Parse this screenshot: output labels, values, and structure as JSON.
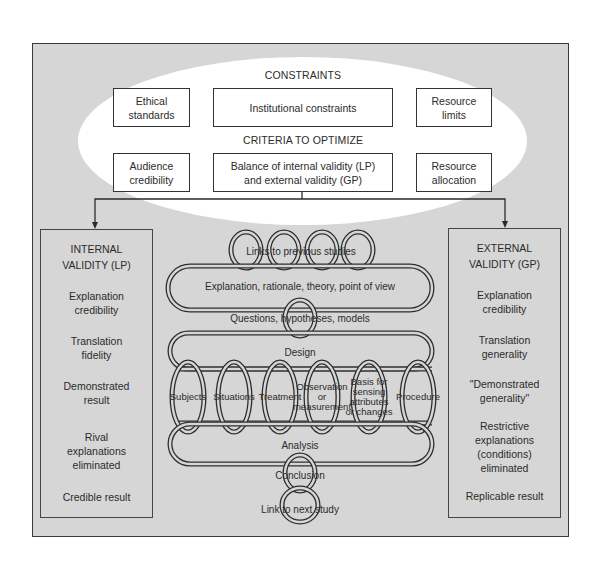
{
  "top_section": {
    "constraints_heading": "CONSTRAINTS",
    "constraints": [
      {
        "label": "Ethical\nstandards"
      },
      {
        "label": "Institutional constraints"
      },
      {
        "label": "Resource\nlimits"
      }
    ],
    "criteria_heading": "CRITERIA TO OPTIMIZE",
    "criteria": [
      {
        "label": "Audience\ncredibility"
      },
      {
        "label": "Balance of internal validity (LP)\nand external validity (GP)"
      },
      {
        "label": "Resource\nallocation"
      }
    ]
  },
  "internal_validity": {
    "title": "INTERNAL\nVALIDITY (LP)",
    "items": [
      "Explanation\ncredibility",
      "Translation\nfidelity",
      "Demonstrated\nresult",
      "Rival\nexplanations\neliminated",
      "Credible result"
    ]
  },
  "external_validity": {
    "title": "EXTERNAL\nVALIDITY (GP)",
    "items": [
      "Explanation\ncredibility",
      "Translation\ngenerality",
      "\"Demonstrated\ngenerality\"",
      "Restrictive\nexplanations\n(conditions)\neliminated",
      "Replicable result"
    ]
  },
  "coil": {
    "links_previous": "Links to previous studies",
    "explanation": "Explanation, rationale, theory, point of view",
    "questions": "Questions, hypotheses, models",
    "design": "Design",
    "design_elements": [
      {
        "lines": [
          "Subjects"
        ]
      },
      {
        "lines": [
          "Situations"
        ]
      },
      {
        "lines": [
          "Treatment"
        ]
      },
      {
        "lines": [
          "Observation",
          "or",
          "measurement"
        ]
      },
      {
        "lines": [
          "Basis for",
          "sensing",
          "attributes",
          "or changes"
        ]
      },
      {
        "lines": [
          "Procedure"
        ]
      }
    ],
    "analysis": "Analysis",
    "conclusion": "Conclusion",
    "link_next": "Link to next study"
  },
  "colors": {
    "panel_background": "#d6d6d6",
    "ellipse_fill": "#ffffff",
    "stroke": "#333333"
  }
}
